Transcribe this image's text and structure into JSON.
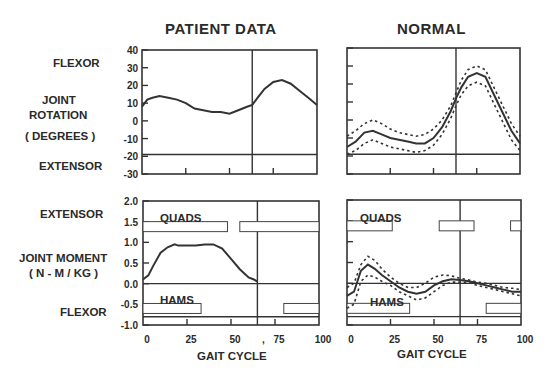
{
  "titles": {
    "patient": "PATIENT DATA",
    "normal": "NORMAL"
  },
  "left_labels": {
    "flexor_top": "FLEXOR",
    "rotation_1": "JOINT",
    "rotation_2": "ROTATION",
    "rotation_3": "( DEGREES )",
    "extensor_top": "EXTENSOR",
    "extensor_bottom": "EXTENSOR",
    "moment_1": "JOINT MOMENT",
    "moment_2": "( N - M / KG )",
    "flexor_bottom": "FLEXOR"
  },
  "band_labels": {
    "quads": "QUADS",
    "hams": "HAMS"
  },
  "xlabel": "GAIT CYCLE",
  "chart_data": [
    {
      "type": "line",
      "title": "PATIENT DATA - Joint Rotation",
      "xlabel": "GAIT CYCLE",
      "ylabel": "JOINT ROTATION (DEGREES)",
      "xlim": [
        0,
        100
      ],
      "ylim": [
        -30,
        40
      ],
      "yticks": [
        40,
        30,
        20,
        10,
        0,
        -10,
        -20,
        -30
      ],
      "toe_off": 63,
      "reference_line": -19,
      "x": [
        0,
        3,
        6,
        10,
        15,
        20,
        25,
        30,
        35,
        40,
        45,
        50,
        55,
        60,
        63,
        66,
        70,
        75,
        80,
        85,
        90,
        95,
        100
      ],
      "series": [
        {
          "name": "patient",
          "values": [
            8,
            12,
            13,
            14,
            13,
            12,
            10,
            7,
            6,
            5,
            5,
            4,
            6,
            8,
            9,
            13,
            18,
            22,
            23,
            21,
            17,
            13,
            9
          ]
        }
      ]
    },
    {
      "type": "line",
      "title": "NORMAL - Joint Rotation",
      "xlim": [
        0,
        100
      ],
      "ylim": [
        -30,
        40
      ],
      "toe_off": 63,
      "reference_line": -19,
      "x": [
        0,
        5,
        10,
        15,
        20,
        25,
        30,
        35,
        40,
        45,
        50,
        55,
        60,
        63,
        66,
        70,
        75,
        80,
        85,
        90,
        95,
        100
      ],
      "series": [
        {
          "name": "mean",
          "values": [
            -15,
            -12,
            -7,
            -6,
            -8,
            -10,
            -11,
            -12,
            -13,
            -13,
            -10,
            -4,
            5,
            12,
            18,
            24,
            26,
            24,
            14,
            4,
            -6,
            -13
          ]
        },
        {
          "name": "upper",
          "values": [
            -9,
            -6,
            -2,
            0,
            -2,
            -5,
            -7,
            -8,
            -9,
            -8,
            -5,
            0,
            8,
            15,
            22,
            28,
            30,
            28,
            18,
            8,
            -2,
            -9
          ]
        },
        {
          "name": "lower",
          "values": [
            -19,
            -17,
            -13,
            -11,
            -13,
            -15,
            -16,
            -17,
            -18,
            -17,
            -14,
            -8,
            1,
            8,
            14,
            19,
            21,
            19,
            9,
            -1,
            -11,
            -17
          ]
        }
      ]
    },
    {
      "type": "line",
      "title": "PATIENT DATA - Joint Moment",
      "xlabel": "GAIT CYCLE",
      "ylabel": "JOINT MOMENT (N-M/KG)",
      "xlim": [
        0,
        100
      ],
      "ylim": [
        -1.0,
        2.0
      ],
      "yticks": [
        2.0,
        1.5,
        1.0,
        0.5,
        0.0,
        -0.5,
        -1.0
      ],
      "xticks": [
        0,
        25,
        50,
        75,
        100
      ],
      "toe_off": 65,
      "x": [
        0,
        3,
        6,
        10,
        14,
        18,
        20,
        25,
        30,
        35,
        40,
        45,
        50,
        55,
        60,
        63,
        65
      ],
      "series": [
        {
          "name": "patient",
          "values": [
            0.1,
            0.2,
            0.45,
            0.75,
            0.88,
            0.95,
            0.92,
            0.92,
            0.92,
            0.95,
            0.95,
            0.85,
            0.6,
            0.35,
            0.15,
            0.1,
            0.05
          ]
        }
      ],
      "emg_bands": {
        "quads": [
          [
            0,
            48
          ],
          [
            55,
            100
          ]
        ],
        "hams": [
          [
            0,
            33
          ],
          [
            80,
            100
          ]
        ]
      }
    },
    {
      "type": "line",
      "title": "NORMAL - Joint Moment",
      "xlim": [
        0,
        100
      ],
      "ylim": [
        -1.0,
        2.0
      ],
      "xticks": [
        0,
        25,
        50,
        75,
        100
      ],
      "toe_off": 65,
      "x": [
        0,
        4,
        8,
        12,
        16,
        20,
        25,
        30,
        35,
        40,
        45,
        50,
        55,
        60,
        65,
        70,
        75,
        80,
        85,
        90,
        95,
        100
      ],
      "series": [
        {
          "name": "mean",
          "values": [
            -0.3,
            -0.2,
            0.3,
            0.45,
            0.35,
            0.2,
            0.05,
            -0.1,
            -0.2,
            -0.25,
            -0.2,
            -0.05,
            0.05,
            0.1,
            0.08,
            0.05,
            0.0,
            -0.05,
            -0.1,
            -0.15,
            -0.2,
            -0.2
          ]
        },
        {
          "name": "upper",
          "values": [
            -0.1,
            0.0,
            0.45,
            0.65,
            0.55,
            0.35,
            0.15,
            0.0,
            -0.1,
            -0.1,
            0.0,
            0.15,
            0.2,
            0.18,
            0.12,
            0.08,
            0.03,
            0.0,
            -0.05,
            -0.1,
            -0.12,
            -0.15
          ]
        },
        {
          "name": "lower",
          "values": [
            -0.6,
            -0.5,
            0.05,
            0.2,
            0.15,
            0.05,
            -0.05,
            -0.2,
            -0.3,
            -0.4,
            -0.35,
            -0.2,
            -0.05,
            0.03,
            0.03,
            0.02,
            -0.05,
            -0.1,
            -0.15,
            -0.2,
            -0.25,
            -0.3
          ]
        }
      ],
      "emg_bands": {
        "quads": [
          [
            0,
            26
          ],
          [
            53,
            73
          ],
          [
            94,
            100
          ]
        ],
        "hams": [
          [
            0,
            36
          ],
          [
            80,
            100
          ]
        ]
      }
    }
  ],
  "top_yticks": [
    "40",
    "30",
    "20",
    "10",
    "0",
    "-10",
    "-20",
    "-30"
  ],
  "bottom_yticks": [
    "2.0",
    "1.5",
    "1.0",
    "0.5",
    "0.0",
    "-0.5",
    "-1.0"
  ],
  "xticks": [
    "0",
    "25",
    "50",
    "75",
    "100"
  ],
  "stray_mark": ","
}
